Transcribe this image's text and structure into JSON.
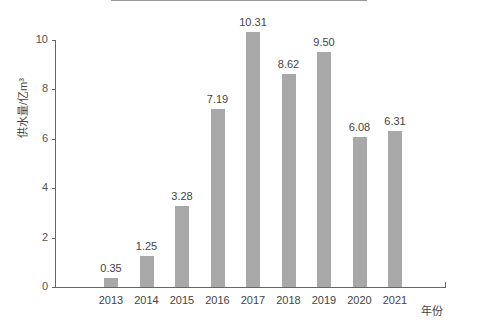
{
  "chart_data": {
    "type": "bar",
    "title": "",
    "xlabel": "年份",
    "ylabel": "供水量/亿m³",
    "ylim": [
      0,
      10
    ],
    "yticks": [
      0,
      2,
      4,
      6,
      8,
      10
    ],
    "grid": false,
    "categories": [
      "2013",
      "2014",
      "2015",
      "2016",
      "2017",
      "2018",
      "2019",
      "2020",
      "2021"
    ],
    "values": [
      0.35,
      1.25,
      3.28,
      7.19,
      10.31,
      8.62,
      9.5,
      6.08,
      6.31
    ],
    "value_labels": [
      "0.35",
      "1.25",
      "3.28",
      "7.19",
      "10.31",
      "8.62",
      "9.50",
      "6.08",
      "6.31"
    ],
    "bar_color": "#a8a8a8"
  }
}
